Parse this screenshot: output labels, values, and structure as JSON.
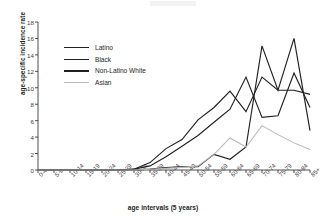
{
  "chart_data": {
    "type": "line",
    "title": "",
    "xlabel": "age intervals (5 years)",
    "ylabel": "age-specific incidence rate",
    "ylim": [
      0,
      18
    ],
    "ytick_step": 2,
    "yticks": [
      "18",
      "16",
      "14",
      "12",
      "10",
      "8",
      "6",
      "4",
      "2",
      "0"
    ],
    "grid": false,
    "legend_position": "upper-left-inside",
    "categories": [
      "0-4",
      "5-9",
      "10-14",
      "15-19",
      "20-24",
      "25-29",
      "30-34",
      "35-39",
      "40-44",
      "45-49",
      "50-54",
      "55-59",
      "60-64",
      "65-69",
      "70-74",
      "75-79",
      "80-84",
      "85+"
    ],
    "series": [
      {
        "name": "Latino",
        "color": "#231f20",
        "width": 1.15,
        "values": [
          0,
          0,
          0,
          0,
          0,
          0,
          0,
          0.1,
          0.3,
          0.4,
          0.4,
          1.9,
          1.3,
          2.8,
          15.1,
          9.7,
          16.0,
          4.8
        ]
      },
      {
        "name": "Black",
        "color": "#231f20",
        "width": 1.15,
        "values": [
          0,
          0,
          0,
          0,
          0,
          0,
          0.1,
          0.5,
          1.6,
          2.9,
          4.2,
          5.8,
          7.4,
          11.3,
          6.4,
          6.6,
          11.8,
          7.6
        ]
      },
      {
        "name": "Non-Latino White",
        "color": "#231f20",
        "width": 1.15,
        "values": [
          0,
          0,
          0,
          0,
          0,
          0,
          0.1,
          0.9,
          2.6,
          3.7,
          6.1,
          7.6,
          9.6,
          7.1,
          11.3,
          9.7,
          9.7,
          9.2
        ]
      },
      {
        "name": "Asian",
        "color": "#b9b9b9",
        "width": 1.05,
        "values": [
          0,
          0,
          0,
          0,
          0,
          0,
          0,
          0.1,
          0.2,
          0.3,
          0.5,
          1.9,
          3.9,
          2.8,
          5.4,
          4.3,
          3.3,
          2.5
        ]
      }
    ]
  },
  "legend": {
    "items": [
      {
        "label": "Latino"
      },
      {
        "label": "Black"
      },
      {
        "label": "Non-Latino White"
      },
      {
        "label": "Asian"
      }
    ]
  }
}
